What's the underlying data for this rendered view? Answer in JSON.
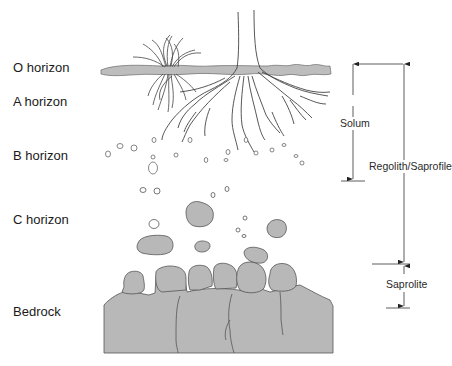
{
  "diagram": {
    "type": "soil-profile",
    "colors": {
      "rock_fill": "#b8b8b8",
      "o_horizon_fill": "#bdbdbd",
      "outline": "#555555",
      "line": "#333333",
      "background": "#ffffff"
    },
    "horizons": [
      {
        "id": "O",
        "label": "O horizon"
      },
      {
        "id": "A",
        "label": "A horizon"
      },
      {
        "id": "B",
        "label": "B horizon"
      },
      {
        "id": "C",
        "label": "C horizon"
      },
      {
        "id": "R",
        "label": "Bedrock"
      }
    ],
    "dimensions": [
      {
        "id": "solum",
        "label": "Solum"
      },
      {
        "id": "regolith",
        "label": "Regolith/Saprofile"
      },
      {
        "id": "saprolite",
        "label": "Saprolite"
      }
    ]
  }
}
